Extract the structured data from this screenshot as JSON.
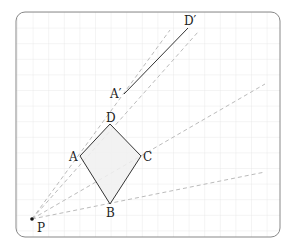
{
  "diagram": {
    "type": "geometry-dilation",
    "frame": {
      "x": 16,
      "y": 12,
      "width": 264,
      "height": 225,
      "radius": 9,
      "stroke": "#888888"
    },
    "grid": {
      "spacing": 15.6,
      "color": "#e4e4e4"
    },
    "colors": {
      "line": "#333333",
      "ray": "#bbbbbb",
      "fill": "#f0f0f0",
      "point": "#111111"
    },
    "center": {
      "name": "P",
      "label": "P",
      "x": 32,
      "y": 219
    },
    "points": {
      "A": {
        "label": "A",
        "x": 80,
        "y": 156
      },
      "B": {
        "label": "B",
        "x": 110,
        "y": 204
      },
      "C": {
        "label": "C",
        "x": 141,
        "y": 156
      },
      "D": {
        "label": "D",
        "x": 110,
        "y": 124
      },
      "A_prime": {
        "label": "A′",
        "x": 124,
        "y": 94
      },
      "D_prime": {
        "label": "D′",
        "x": 188,
        "y": 28
      }
    },
    "shapes": [
      {
        "name": "rhombus-ABCD",
        "vertices": [
          "A",
          "D",
          "C",
          "B"
        ]
      },
      {
        "name": "segment-A-prime-D-prime",
        "vertices": [
          "A_prime",
          "D_prime"
        ]
      }
    ],
    "rays": [
      {
        "through": "A",
        "end": [
          170,
          30
        ]
      },
      {
        "through": "D",
        "end": [
          198,
          32
        ]
      },
      {
        "through": "C",
        "end": [
          265,
          84
        ]
      },
      {
        "through": "B",
        "end": [
          265,
          172
        ]
      }
    ]
  }
}
